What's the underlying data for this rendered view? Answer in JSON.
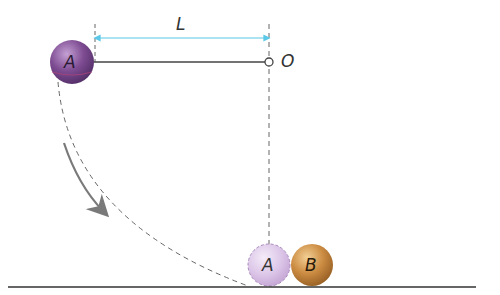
{
  "diagram": {
    "length_label": "L",
    "pivot_label": "O",
    "ball_a_label": "A",
    "ball_a_ghost_label": "A",
    "ball_b_label": "B"
  },
  "colors": {
    "ball_a": "#7a4a8c",
    "ball_a_ghost": "#dcc6e8",
    "ball_b": "#c98a3e",
    "dimension_arrow": "#5bc8e8",
    "rod": "#444444",
    "dashed": "#666666",
    "motion_arrow": "#7a7a7a",
    "ground": "#333333"
  }
}
